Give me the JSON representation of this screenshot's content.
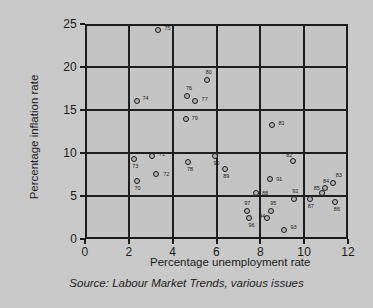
{
  "chart_data": {
    "type": "scatter",
    "title": "",
    "xlabel": "Percentage unemployment rate",
    "ylabel": "Percentage inflation rate",
    "source": "Source: Labour Market Trends, various issues",
    "xlim": [
      0,
      12
    ],
    "ylim": [
      0,
      25
    ],
    "xticks": [
      "0",
      "2",
      "4",
      "6",
      "8",
      "10",
      "12"
    ],
    "yticks": [
      "0",
      "5",
      "10",
      "15",
      "20",
      "25"
    ],
    "grid": true,
    "legend": "none",
    "point_label_meaning": "two-digit year",
    "points": [
      {
        "label": "70",
        "x": 2.35,
        "y": 6.8,
        "lx": -2,
        "ly": 7
      },
      {
        "label": "71",
        "x": 3.05,
        "y": 9.7,
        "lx": 7,
        "ly": -2
      },
      {
        "label": "72",
        "x": 3.25,
        "y": 7.6,
        "lx": 7,
        "ly": 0
      },
      {
        "label": "73",
        "x": 2.25,
        "y": 9.3,
        "lx": -2,
        "ly": 7
      },
      {
        "label": "74",
        "x": 2.35,
        "y": 16.0,
        "lx": 6,
        "ly": -3
      },
      {
        "label": "75",
        "x": 3.35,
        "y": 24.3,
        "lx": 6,
        "ly": -2
      },
      {
        "label": "76",
        "x": 4.65,
        "y": 16.6,
        "lx": -1,
        "ly": -8
      },
      {
        "label": "77",
        "x": 5.0,
        "y": 16.1,
        "lx": 7,
        "ly": -2
      },
      {
        "label": "78",
        "x": 4.7,
        "y": 8.9,
        "lx": -1,
        "ly": 7
      },
      {
        "label": "79",
        "x": 4.6,
        "y": 13.9,
        "lx": 6,
        "ly": -1
      },
      {
        "label": "80",
        "x": 5.55,
        "y": 18.5,
        "lx": -1,
        "ly": -8
      },
      {
        "label": "81",
        "x": 8.55,
        "y": 13.2,
        "lx": 6,
        "ly": -2
      },
      {
        "label": "82",
        "x": 9.5,
        "y": 9.1,
        "lx": -7,
        "ly": -6
      },
      {
        "label": "83",
        "x": 11.3,
        "y": 6.5,
        "lx": 3,
        "ly": -8
      },
      {
        "label": "84",
        "x": 10.95,
        "y": 5.9,
        "lx": -2,
        "ly": -7
      },
      {
        "label": "85",
        "x": 10.8,
        "y": 5.3,
        "lx": -8,
        "ly": -5
      },
      {
        "label": "86",
        "x": 11.4,
        "y": 4.3,
        "lx": -1,
        "ly": 7
      },
      {
        "label": "87",
        "x": 10.25,
        "y": 4.7,
        "lx": -2,
        "ly": 7
      },
      {
        "label": "88",
        "x": 7.8,
        "y": 5.3,
        "lx": 6,
        "ly": 0
      },
      {
        "label": "89",
        "x": 6.4,
        "y": 8.1,
        "lx": -2,
        "ly": 7
      },
      {
        "label": "90",
        "x": 5.95,
        "y": 9.7,
        "lx": -2,
        "ly": 7
      },
      {
        "label": "91",
        "x": 8.45,
        "y": 7.0,
        "lx": 6,
        "ly": 0
      },
      {
        "label": "92",
        "x": 9.55,
        "y": 4.6,
        "lx": -2,
        "ly": -8
      },
      {
        "label": "93",
        "x": 9.1,
        "y": 1.1,
        "lx": 6,
        "ly": -3
      },
      {
        "label": "94",
        "x": 8.3,
        "y": 2.4,
        "lx": -8,
        "ly": -2
      },
      {
        "label": "95",
        "x": 8.5,
        "y": 3.2,
        "lx": -1,
        "ly": -8
      },
      {
        "label": "96",
        "x": 7.5,
        "y": 2.5,
        "lx": -1,
        "ly": 7
      },
      {
        "label": "97",
        "x": 7.4,
        "y": 3.3,
        "lx": -3,
        "ly": -8
      }
    ]
  }
}
